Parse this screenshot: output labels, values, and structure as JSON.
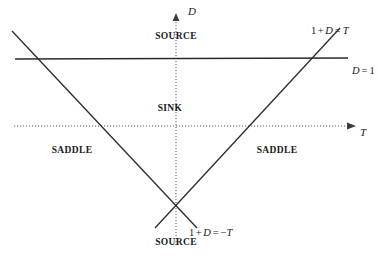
{
  "figure": {
    "background_color": "#ffffff",
    "line_color": "#2b2b2b",
    "axis_color": "#555555"
  },
  "axes": {
    "horizontal": {
      "name": "T",
      "style": "dotted",
      "arrow": "right",
      "y": 126,
      "x_start": 14,
      "x_end": 352,
      "label_x": 361,
      "label_y": 133
    },
    "vertical": {
      "name": "D",
      "style": "dotted",
      "arrow": "up",
      "x": 176,
      "y_start": 15,
      "y_end": 247,
      "label_x": 188,
      "label_y": 12
    }
  },
  "lines": [
    {
      "id": "d-equals-1",
      "label": "D = 1",
      "label_math": {
        "lhs": "D",
        "rel": "=",
        "rhs": "1"
      },
      "style": "solid",
      "x1": 15,
      "y1": 59,
      "x2": 348,
      "y2": 58,
      "label_x": 352,
      "label_y": 72
    },
    {
      "id": "one-plus-d-equals-t",
      "label": "1 + D = T",
      "style": "solid",
      "x1": 340,
      "y1": 28,
      "x2": 155,
      "y2": 228,
      "label_x": 311,
      "label_y": 31
    },
    {
      "id": "one-plus-d-equals-minus-t",
      "label": "1 + D = −T",
      "style": "solid",
      "x1": 12,
      "y1": 31,
      "x2": 197,
      "y2": 228,
      "label_x": 189,
      "label_y": 233
    }
  ],
  "regions": [
    {
      "id": "source-top",
      "label": "SOURCE",
      "x": 176,
      "y": 37
    },
    {
      "id": "sink",
      "label": "SINK",
      "x": 170,
      "y": 109
    },
    {
      "id": "saddle-left",
      "label": "SADDLE",
      "x": 72,
      "y": 151
    },
    {
      "id": "saddle-right",
      "label": "SADDLE",
      "x": 277,
      "y": 151
    },
    {
      "id": "source-bottom",
      "label": "SOURCE",
      "x": 176,
      "y": 243
    }
  ],
  "math_labels": {
    "one_plus_d_eq_t": {
      "a": "1",
      "plus": "+",
      "d": "D",
      "eq": "=",
      "t": "T"
    },
    "one_plus_d_eq_minus_t": {
      "a": "1",
      "plus": "+",
      "d": "D",
      "eq": "=",
      "minus": "−",
      "t": "T"
    },
    "d_eq_1": {
      "d": "D",
      "eq": "=",
      "one": "1"
    }
  }
}
